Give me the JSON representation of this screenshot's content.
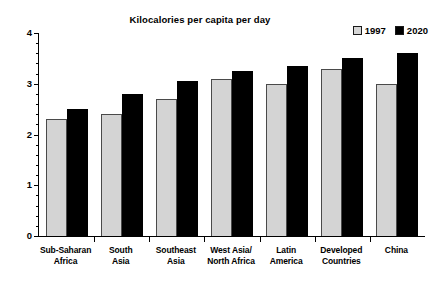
{
  "chart_data": {
    "type": "bar",
    "title": "Kilocalories per capita per day",
    "xlabel": "",
    "ylabel": "",
    "ylim": [
      0,
      4
    ],
    "ytick_labels": [
      "0",
      "1",
      "2",
      "3",
      "4"
    ],
    "ytick_values": [
      0,
      1,
      2,
      3,
      4
    ],
    "minor_tick_step": 0.2,
    "grid": false,
    "legend_position": "top-right",
    "categories": [
      "Sub-Saharan Africa",
      "South Asia",
      "Southeast Asia",
      "West Asia/ North Africa",
      "Latin America",
      "Developed Countries",
      "China"
    ],
    "category_lines": [
      [
        "Sub-Saharan",
        "Africa"
      ],
      [
        "South",
        "Asia"
      ],
      [
        "Southeast",
        "Asia"
      ],
      [
        "West Asia/",
        "North Africa"
      ],
      [
        "Latin",
        "America"
      ],
      [
        "Developed",
        "Countries"
      ],
      [
        "China",
        ""
      ]
    ],
    "series": [
      {
        "name": "1997",
        "color": "#d4d4d4",
        "values": [
          2.3,
          2.4,
          2.7,
          3.1,
          3.0,
          3.3,
          3.0
        ]
      },
      {
        "name": "2020",
        "color": "#000000",
        "values": [
          2.5,
          2.8,
          3.05,
          3.25,
          3.35,
          3.5,
          3.6
        ]
      }
    ]
  },
  "legend": {
    "entries": [
      {
        "label": "1997"
      },
      {
        "label": "2020"
      }
    ]
  }
}
